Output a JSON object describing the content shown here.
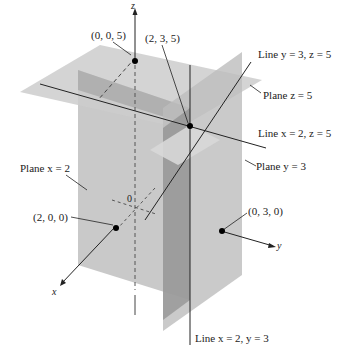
{
  "figure": {
    "colors": {
      "plane_x2": "#c8c8c8",
      "plane_y3": "#b4b4b4",
      "plane_z5": "#cfcfcf",
      "overlap_dark": "#9a9a9a",
      "line": "#222222",
      "point": "#000000"
    },
    "axes": {
      "x": "x",
      "y": "y",
      "z": "z",
      "origin": "0"
    },
    "points": [
      {
        "id": "p005",
        "label": "(0, 0, 5)"
      },
      {
        "id": "p235",
        "label": "(2, 3, 5)"
      },
      {
        "id": "p200",
        "label": "(2, 0, 0)"
      },
      {
        "id": "p030",
        "label": "(0, 3, 0)"
      }
    ],
    "labels": {
      "line_y3_z5": "Line y = 3, z = 5",
      "plane_z5": "Plane z = 5",
      "line_x2_z5": "Line x = 2, z = 5",
      "plane_y3": "Plane y = 3",
      "plane_x2": "Plane x = 2",
      "line_x2_y3": "Line x = 2, y = 3"
    }
  }
}
